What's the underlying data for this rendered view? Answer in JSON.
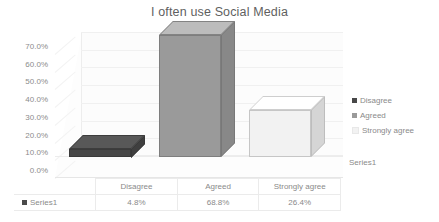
{
  "chart_data": {
    "type": "bar",
    "title": "I often use Social Media",
    "xlabel": "",
    "ylabel": "",
    "categories": [
      "Disagree",
      "Agreed",
      "Strongly agree"
    ],
    "series": [
      {
        "name": "Series1",
        "values": [
          4.8,
          68.8,
          26.4
        ],
        "value_labels": [
          "4.8%",
          "68.8%",
          "26.4%"
        ]
      }
    ],
    "ylim": [
      0,
      70
    ],
    "ytick_labels": [
      "70.0%",
      "60.0%",
      "50.0%",
      "40.0%",
      "30.0%",
      "20.0%",
      "10.0%",
      "0.0%"
    ],
    "ytick_values": [
      70,
      60,
      50,
      40,
      30,
      20,
      10,
      0
    ],
    "grid": true,
    "legend_position": "right",
    "legend_entries": [
      {
        "label": "Disagree",
        "color": "#484848"
      },
      {
        "label": "Agreed",
        "color": "#9a9a9a"
      },
      {
        "label": "Strongly agree",
        "color": "#f2f2f2"
      }
    ],
    "series_axis_label": "Series1",
    "data_table": {
      "row_label": "Series1",
      "columns": [
        "Disagree",
        "Agreed",
        "Strongly agree"
      ],
      "values": [
        "4.8%",
        "68.8%",
        "26.4%"
      ]
    },
    "bar_colors": [
      "#484848",
      "#9a9a9a",
      "#f2f2f2"
    ],
    "style": "3d-column"
  }
}
